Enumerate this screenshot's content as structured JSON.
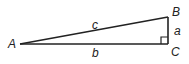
{
  "diagram": {
    "type": "right-triangle",
    "vertices": {
      "A": {
        "label": "A"
      },
      "B": {
        "label": "B"
      },
      "C": {
        "label": "C"
      }
    },
    "sides": {
      "a": {
        "label": "a",
        "between": [
          "B",
          "C"
        ]
      },
      "b": {
        "label": "b",
        "between": [
          "A",
          "C"
        ]
      },
      "c": {
        "label": "c",
        "between": [
          "A",
          "B"
        ]
      }
    },
    "right_angle_at": "C",
    "colors": {
      "stroke": "#222222",
      "background": "#ffffff"
    }
  }
}
